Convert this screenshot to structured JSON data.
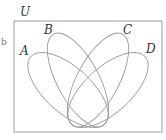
{
  "diagram": {
    "universe_label": "U",
    "side_mark": "b",
    "sets": [
      {
        "name": "A"
      },
      {
        "name": "B"
      },
      {
        "name": "C"
      },
      {
        "name": "D"
      }
    ],
    "line_color": "#9a9a9a"
  }
}
